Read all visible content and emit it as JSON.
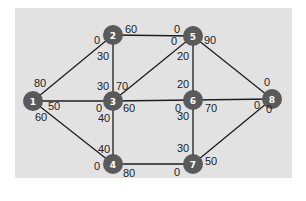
{
  "diagram": {
    "type": "network-flow-graph",
    "panel": {
      "x": 15,
      "y": 8,
      "width": 277,
      "height": 170,
      "color": "#e2e2e2"
    },
    "node_color": "#5a5a5a",
    "edge_color": "#1e1e1e",
    "nodes": [
      {
        "id": "1",
        "label": "1",
        "x": 33,
        "y": 101
      },
      {
        "id": "2",
        "label": "2",
        "x": 113,
        "y": 35
      },
      {
        "id": "3",
        "label": "3",
        "x": 113,
        "y": 101
      },
      {
        "id": "4",
        "label": "4",
        "x": 113,
        "y": 164
      },
      {
        "id": "5",
        "label": "5",
        "x": 193,
        "y": 36
      },
      {
        "id": "6",
        "label": "6",
        "x": 193,
        "y": 100
      },
      {
        "id": "7",
        "label": "7",
        "x": 193,
        "y": 164
      },
      {
        "id": "8",
        "label": "8",
        "x": 272,
        "y": 99
      }
    ],
    "edges": [
      {
        "from": "1",
        "to": "2",
        "cap_from": "80",
        "cap_to": "0"
      },
      {
        "from": "1",
        "to": "3",
        "cap_from": "50",
        "cap_to": "0"
      },
      {
        "from": "1",
        "to": "4",
        "cap_from": "60",
        "cap_to": "0"
      },
      {
        "from": "2",
        "to": "3",
        "cap_from": "30",
        "cap_to": "30"
      },
      {
        "from": "2",
        "to": "5",
        "cap_from": "60",
        "cap_to": "0"
      },
      {
        "from": "3",
        "to": "5",
        "cap_from": "70",
        "cap_to": "0"
      },
      {
        "from": "3",
        "to": "4",
        "cap_from": "40",
        "cap_to": "40"
      },
      {
        "from": "3",
        "to": "6",
        "cap_from": "60",
        "cap_to": "0"
      },
      {
        "from": "4",
        "to": "7",
        "cap_from": "80",
        "cap_to": "0"
      },
      {
        "from": "5",
        "to": "6",
        "cap_from": "20",
        "cap_to": "20"
      },
      {
        "from": "5",
        "to": "8",
        "cap_from": "90",
        "cap_to": "0"
      },
      {
        "from": "6",
        "to": "8",
        "cap_from": "70",
        "cap_to": "0"
      },
      {
        "from": "6",
        "to": "7",
        "cap_from": "30",
        "cap_to": "30"
      },
      {
        "from": "7",
        "to": "8",
        "cap_from": "50",
        "cap_to": "0"
      }
    ],
    "capacity_labels": [
      {
        "edge": "1-2",
        "text": "80",
        "x": 34,
        "y": 87
      },
      {
        "edge": "1-2",
        "text": "0",
        "x": 94,
        "y": 44
      },
      {
        "edge": "1-3",
        "text": "50",
        "x": 48,
        "y": 110
      },
      {
        "edge": "1-3",
        "text": "0",
        "x": 96,
        "y": 112
      },
      {
        "edge": "1-4",
        "text": "60",
        "x": 35,
        "y": 121
      },
      {
        "edge": "1-4",
        "text": "0",
        "x": 94,
        "y": 170
      },
      {
        "edge": "2-3",
        "text": "30",
        "x": 97,
        "y": 60
      },
      {
        "edge": "2-3",
        "text": "30",
        "x": 97,
        "y": 90
      },
      {
        "edge": "2-5",
        "text": "60",
        "x": 125,
        "y": 33
      },
      {
        "edge": "2-5",
        "text": "0",
        "x": 174,
        "y": 33
      },
      {
        "edge": "3-5",
        "text": "70",
        "x": 116,
        "y": 90
      },
      {
        "edge": "3-5",
        "text": "0",
        "x": 171,
        "y": 45
      },
      {
        "edge": "3-4",
        "text": "40",
        "x": 98,
        "y": 122
      },
      {
        "edge": "3-4",
        "text": "40",
        "x": 98,
        "y": 153
      },
      {
        "edge": "3-6",
        "text": "60",
        "x": 123,
        "y": 112
      },
      {
        "edge": "3-6",
        "text": "0",
        "x": 175,
        "y": 112
      },
      {
        "edge": "4-7",
        "text": "80",
        "x": 123,
        "y": 177
      },
      {
        "edge": "4-7",
        "text": "0",
        "x": 174,
        "y": 176
      },
      {
        "edge": "5-6",
        "text": "20",
        "x": 177,
        "y": 60
      },
      {
        "edge": "5-6",
        "text": "20",
        "x": 177,
        "y": 88
      },
      {
        "edge": "5-8",
        "text": "90",
        "x": 204,
        "y": 44
      },
      {
        "edge": "5-8",
        "text": "0",
        "x": 264,
        "y": 86
      },
      {
        "edge": "6-8",
        "text": "70",
        "x": 205,
        "y": 112
      },
      {
        "edge": "6-8",
        "text": "0",
        "x": 254,
        "y": 109
      },
      {
        "edge": "6-7",
        "text": "30",
        "x": 177,
        "y": 120
      },
      {
        "edge": "6-7",
        "text": "30",
        "x": 177,
        "y": 152
      },
      {
        "edge": "7-8",
        "text": "50",
        "x": 205,
        "y": 165
      },
      {
        "edge": "7-8",
        "text": "0",
        "x": 266,
        "y": 113
      }
    ]
  }
}
